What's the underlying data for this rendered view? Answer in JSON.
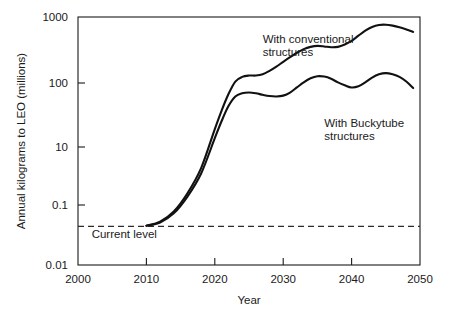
{
  "chart_data": {
    "type": "line",
    "title": "",
    "xlabel": "Year",
    "ylabel": "Annual kilograms to LEO (millions)",
    "yscale": "log",
    "xlim": [
      2000,
      2050
    ],
    "ylim": [
      0.01,
      1000
    ],
    "grid": false,
    "legend_position": "inline-annotations",
    "xticks": [
      2000,
      2010,
      2020,
      2030,
      2040,
      2050
    ],
    "xtick_labels": [
      "2000",
      "2010",
      "2020",
      "2030",
      "2040",
      "2050"
    ],
    "yticks": [
      1000,
      100,
      10,
      0.1,
      0.01
    ],
    "ytick_labels": [
      "1000",
      "100",
      "10",
      "0.1",
      "0.01"
    ],
    "annotations": [
      {
        "name": "conventional-label",
        "text_line1": "With conventional",
        "text_line2": "structures",
        "x": 2027,
        "y": 300
      },
      {
        "name": "buckytube-label",
        "text_line1": "With Buckytube",
        "text_line2": "structures",
        "x": 2036,
        "y": 6
      },
      {
        "name": "current-level-label",
        "text": "Current level",
        "x": 2002,
        "y": 0.035
      }
    ],
    "reference_lines": [
      {
        "name": "current-level",
        "label": "Current level",
        "orientation": "horizontal",
        "y": 0.06,
        "style": "dashed"
      }
    ],
    "series": [
      {
        "name": "With conventional structures",
        "style": "solid",
        "color": "#111111",
        "x": [
          2010,
          2012,
          2014,
          2016,
          2018,
          2020,
          2021,
          2022,
          2023,
          2024,
          2025,
          2026,
          2027,
          2028,
          2029,
          2030,
          2031,
          2032,
          2033,
          2034,
          2035,
          2036,
          2037,
          2038,
          2039,
          2040,
          2041,
          2042,
          2043,
          2044,
          2045,
          2046,
          2047,
          2048,
          2049
        ],
        "y": [
          0.062,
          0.075,
          0.12,
          0.28,
          0.9,
          5.5,
          13,
          28,
          50,
          62,
          66,
          66,
          70,
          82,
          100,
          125,
          155,
          190,
          225,
          250,
          262,
          255,
          245,
          250,
          280,
          330,
          420,
          530,
          630,
          690,
          700,
          670,
          620,
          560,
          500
        ]
      },
      {
        "name": "With Buckytube structures",
        "style": "solid",
        "color": "#111111",
        "x": [
          2010,
          2012,
          2014,
          2016,
          2018,
          2020,
          2021,
          2022,
          2023,
          2024,
          2025,
          2026,
          2027,
          2028,
          2029,
          2030,
          2031,
          2032,
          2033,
          2034,
          2035,
          2036,
          2037,
          2038,
          2039,
          2040,
          2041,
          2042,
          2043,
          2044,
          2045,
          2046,
          2047,
          2048,
          2049
        ],
        "y": [
          0.062,
          0.072,
          0.11,
          0.24,
          0.7,
          3.6,
          8.0,
          16,
          25,
          29,
          30,
          29,
          27,
          25.5,
          25,
          26,
          30,
          38,
          48,
          58,
          64,
          63,
          57,
          48,
          42,
          38,
          40,
          48,
          60,
          70,
          74,
          70,
          62,
          50,
          37
        ]
      }
    ]
  },
  "layout": {
    "plot_left": 78,
    "plot_right": 420,
    "plot_top": 17,
    "plot_bottom": 265,
    "y_anchor_top_value": 1000,
    "y_anchor_top_px": 17,
    "y_anchor_bottom_value": 0.01,
    "y_anchor_bottom_px": 265,
    "ytick_px": {
      "1000": 17,
      "100": 83,
      "10": 147,
      "0.1": 205,
      "0.01": 265
    }
  }
}
